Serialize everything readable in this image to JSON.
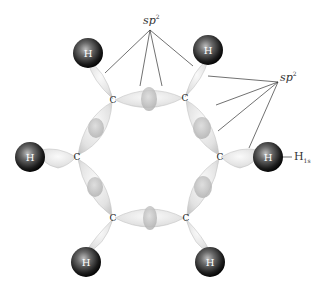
{
  "labels": {
    "sp2_top": "sp",
    "sp2_top_sup": "2",
    "sp2_right": "sp",
    "sp2_right_sup": "2",
    "h1s_main": "H",
    "h1s_sub": "1s"
  },
  "atoms": {
    "carbon_symbol": "C",
    "hydrogen_symbol": "H",
    "carbons": [
      {
        "id": "c1",
        "x": 113,
        "y": 100
      },
      {
        "id": "c2",
        "x": 185,
        "y": 98
      },
      {
        "id": "c3",
        "x": 220,
        "y": 157
      },
      {
        "id": "c4",
        "x": 186,
        "y": 218
      },
      {
        "id": "c5",
        "x": 113,
        "y": 218
      },
      {
        "id": "c6",
        "x": 77,
        "y": 157
      }
    ],
    "hydrogens": [
      {
        "id": "h1",
        "x": 88,
        "y": 53
      },
      {
        "id": "h2",
        "x": 208,
        "y": 50
      },
      {
        "id": "h3",
        "x": 268,
        "y": 157
      },
      {
        "id": "h4",
        "x": 210,
        "y": 262
      },
      {
        "id": "h5",
        "x": 86,
        "y": 262
      },
      {
        "id": "h6",
        "x": 30,
        "y": 157
      }
    ]
  },
  "colors": {
    "orbital_fill": "#e6e6e6",
    "orbital_edge": "#c4c4c4",
    "hydrogen_dark": "#111111",
    "hydrogen_light": "#9a9a9a",
    "leader_line": "#333333"
  }
}
